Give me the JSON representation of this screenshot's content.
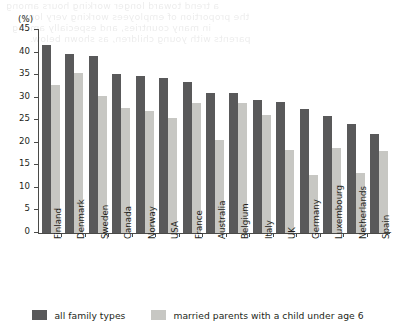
{
  "page": {
    "unit_label": "(%)",
    "bleed_text": [
      "a trend toward longer working hours among",
      "the proportion of employees working very long",
      "in many countries, and especially among",
      "parents with young children, as shown below."
    ]
  },
  "legend": {
    "position": "bottom-center",
    "items": [
      {
        "label": "all family types",
        "color": "#59595a",
        "swatch_name": "legend-swatch-all-family-types"
      },
      {
        "label": "married parents with a child under age 6",
        "color": "#c7c7c3",
        "swatch_name": "legend-swatch-married-parents"
      }
    ]
  },
  "chart_data": {
    "type": "bar",
    "title": "",
    "subtitle": "",
    "xlabel": "",
    "ylabel": "(%)",
    "ylim": [
      0,
      45
    ],
    "yticks": [
      0,
      5,
      10,
      15,
      20,
      25,
      30,
      35,
      40,
      45
    ],
    "grid": false,
    "categories": [
      "Finland",
      "Denmark",
      "Sweden",
      "Canada",
      "Norway",
      "USA",
      "France",
      "Australia",
      "Belgium",
      "Italy",
      "UK",
      "Germany",
      "Luxembourg",
      "Netherlands",
      "Spain"
    ],
    "series": [
      {
        "name": "all family types",
        "color": "#59595a",
        "values": [
          41.6,
          39.7,
          39.3,
          35.2,
          34.7,
          34.3,
          33.5,
          31.1,
          31.0,
          29.4,
          29.1,
          27.5,
          25.9,
          24.1,
          21.9
        ]
      },
      {
        "name": "married parents with a child under age 6",
        "color": "#c7c7c3",
        "values": [
          32.8,
          35.4,
          30.3,
          27.7,
          27.1,
          25.6,
          28.8,
          20.7,
          28.8,
          26.2,
          18.4,
          12.9,
          18.9,
          13.3,
          18.2
        ]
      }
    ]
  }
}
